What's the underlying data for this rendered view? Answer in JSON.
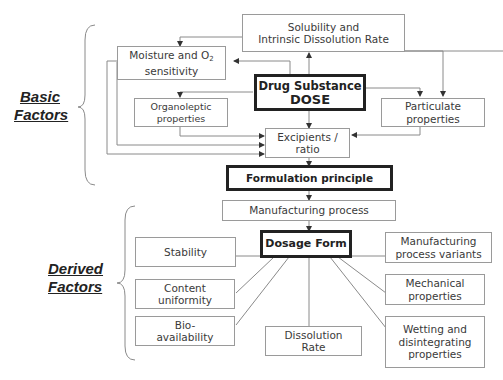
{
  "groups": {
    "basic": "Basic Factors",
    "basic_line1": "Basic",
    "basic_line2": "Factors",
    "derived_line1": "Derived",
    "derived_line2": "Factors"
  },
  "nodes": {
    "solubility_l1": "Solubility and",
    "solubility_l2": "Intrinsic Dissolution Rate",
    "moisture_l1": "Moisture and O",
    "moisture_sub": "2",
    "moisture_l2": "sensitivity",
    "drug_l1": "Drug Substance",
    "drug_l2": "DOSE",
    "organoleptic_l1": "Organoleptic",
    "organoleptic_l2": "properties",
    "particulate_l1": "Particulate",
    "particulate_l2": "properties",
    "excipients_l1": "Excipients /",
    "excipients_l2": "ratio",
    "formulation": "Formulation principle",
    "manufacturing": "Manufacturing process",
    "dosage": "Dosage Form",
    "stability": "Stability",
    "content_l1": "Content",
    "content_l2": "uniformity",
    "bio_l1": "Bio-",
    "bio_l2": "availability",
    "dissolution_l1": "Dissolution",
    "dissolution_l2": "Rate",
    "variants_l1": "Manufacturing",
    "variants_l2": "process variants",
    "mechanical_l1": "Mechanical",
    "mechanical_l2": "properties",
    "wetting_l1": "Wetting and",
    "wetting_l2": "disintegrating",
    "wetting_l3": "properties"
  },
  "colors": {
    "line": "#7a7a7a",
    "box_border": "#9a9a9a",
    "bold_border": "#222222"
  }
}
